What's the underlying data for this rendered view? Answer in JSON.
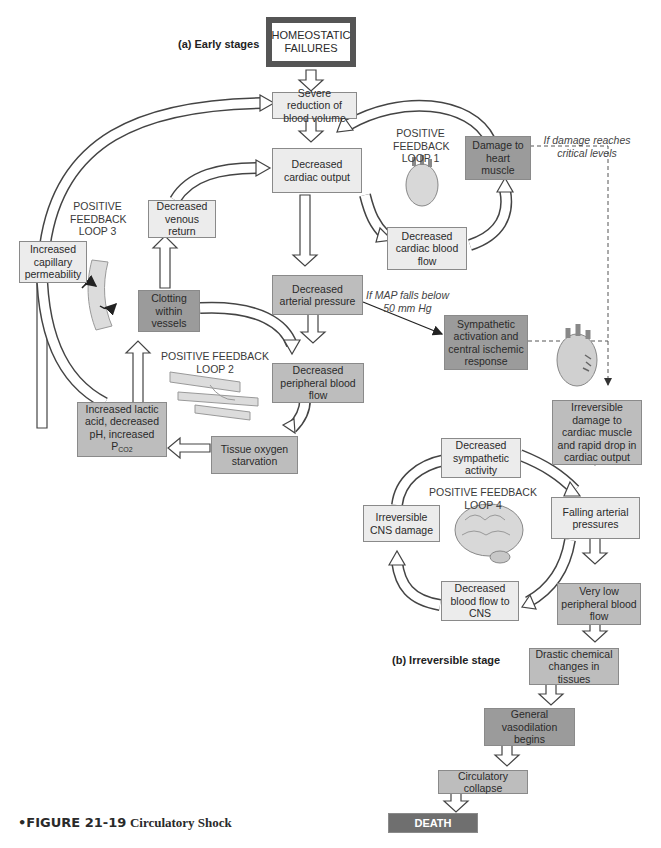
{
  "stages": {
    "early": "(a) Early stages",
    "irreversible": "(b) Irreversible stage"
  },
  "boxes": {
    "homeostatic": "HOMEOSTATIC FAILURES",
    "severe_reduction": "Severe reduction of blood volume",
    "decreased_cardiac_output": "Decreased cardiac output",
    "damage_heart": "Damage to heart muscle",
    "decreased_cardiac_blood_flow": "Decreased cardiac blood flow",
    "decreased_venous_return": "Decreased venous return",
    "increased_capillary_permeability": "Increased capillary permeability",
    "clotting": "Clotting within vessels",
    "decreased_arterial_pressure": "Decreased arterial pressure",
    "decreased_peripheral_blood_flow": "Decreased peripheral blood flow",
    "tissue_oxygen": "Tissue oxygen starvation",
    "lactic_acid": "Increased lactic acid, decreased pH, increased P",
    "lactic_acid_sub": "CO2",
    "sympathetic_activation": "Sympathetic activation and central ischemic response",
    "irreversible_damage": "Irreversible damage to cardiac muscle and rapid drop in cardiac output",
    "decreased_sympathetic": "Decreased sympathetic activity",
    "irreversible_cns": "Irreversible CNS damage",
    "falling_arterial": "Falling arterial pressures",
    "decreased_blood_flow_cns": "Decreased blood flow to CNS",
    "very_low_peripheral": "Very low peripheral blood flow",
    "drastic_chemical": "Drastic chemical changes in tissues",
    "general_vasodilation": "General vasodilation begins",
    "circulatory_collapse": "Circulatory collapse",
    "death": "DEATH"
  },
  "loops": {
    "loop1": "POSITIVE FEEDBACK LOOP 1",
    "loop2": "POSITIVE FEEDBACK LOOP 2",
    "loop3": "POSITIVE FEEDBACK LOOP 3",
    "loop4": "POSITIVE FEEDBACK LOOP 4"
  },
  "annotations": {
    "critical_damage": "If damage reaches critical levels",
    "map_falls": "If MAP falls below 50 mm Hg"
  },
  "illustrations": [
    "heart-icon",
    "blood-vessel-icon",
    "clotted-vessel-icon",
    "damaged-heart-icon",
    "brain-icon"
  ],
  "caption": {
    "figure": "•FIGURE 21-19",
    "title": "Circulatory Shock"
  }
}
